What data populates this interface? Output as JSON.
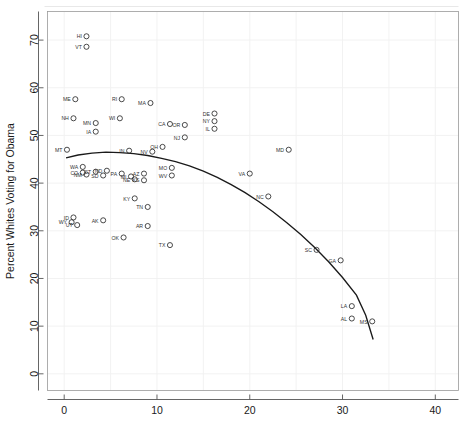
{
  "chart_data": {
    "type": "scatter",
    "title": "",
    "xlabel": "",
    "ylabel": "Percent Whites Voting for Obama",
    "xlim": [
      -1.8,
      42.5
    ],
    "ylim": [
      -3.5,
      76.0
    ],
    "xticks": [
      0,
      10,
      20,
      30,
      40
    ],
    "yticks": [
      0,
      10,
      20,
      30,
      40,
      50,
      60,
      70
    ],
    "xtick_labels": [
      "0",
      "10",
      "20",
      "30",
      "40"
    ],
    "ytick_labels": [
      "0",
      "10",
      "20",
      "30",
      "40",
      "50",
      "60",
      "70"
    ],
    "grid": true,
    "grid_color": "#f0f0f0",
    "legend": "none",
    "marker": "open-circle",
    "marker_color": "#2b2b2b",
    "label_position": "left-of-marker",
    "points": [
      {
        "label": "HI",
        "x": 2.4,
        "y": 70.8
      },
      {
        "label": "VT",
        "x": 2.4,
        "y": 68.6
      },
      {
        "label": "ME",
        "x": 1.2,
        "y": 57.6
      },
      {
        "label": "RI",
        "x": 6.2,
        "y": 57.6
      },
      {
        "label": "MA",
        "x": 9.3,
        "y": 56.8
      },
      {
        "label": "NH",
        "x": 1.0,
        "y": 53.6
      },
      {
        "label": "MN",
        "x": 3.4,
        "y": 52.6
      },
      {
        "label": "WI",
        "x": 6.0,
        "y": 53.6
      },
      {
        "label": "CA",
        "x": 11.4,
        "y": 52.4
      },
      {
        "label": "OR",
        "x": 13.0,
        "y": 52.2
      },
      {
        "label": "IA",
        "x": 3.4,
        "y": 50.8
      },
      {
        "label": "NJ",
        "x": 13.0,
        "y": 49.6
      },
      {
        "label": "DE",
        "x": 16.2,
        "y": 54.6
      },
      {
        "label": "NY",
        "x": 16.2,
        "y": 53.0
      },
      {
        "label": "IL",
        "x": 16.2,
        "y": 51.4
      },
      {
        "label": "MD",
        "x": 24.2,
        "y": 47.0
      },
      {
        "label": "MT",
        "x": 0.3,
        "y": 47.0
      },
      {
        "label": "IN",
        "x": 7.0,
        "y": 46.8
      },
      {
        "label": "NV",
        "x": 9.5,
        "y": 46.6
      },
      {
        "label": "OH",
        "x": 10.6,
        "y": 47.6
      },
      {
        "label": "WA",
        "x": 2.0,
        "y": 43.4
      },
      {
        "label": "CO",
        "x": 2.0,
        "y": 42.2
      },
      {
        "label": "NM",
        "x": 2.4,
        "y": 41.8
      },
      {
        "label": "CT",
        "x": 3.4,
        "y": 42.4
      },
      {
        "label": "SD",
        "x": 4.2,
        "y": 41.6
      },
      {
        "label": "ND",
        "x": 4.6,
        "y": 42.6
      },
      {
        "label": "PA",
        "x": 6.2,
        "y": 42.0
      },
      {
        "label": "MI",
        "x": 7.2,
        "y": 41.4
      },
      {
        "label": "NE",
        "x": 7.6,
        "y": 40.8
      },
      {
        "label": "AZ",
        "x": 8.6,
        "y": 42.0
      },
      {
        "label": "KS",
        "x": 8.6,
        "y": 40.6
      },
      {
        "label": "MO",
        "x": 11.6,
        "y": 43.2
      },
      {
        "label": "WV",
        "x": 11.6,
        "y": 41.6
      },
      {
        "label": "VA",
        "x": 20.0,
        "y": 42.0
      },
      {
        "label": "KY",
        "x": 7.6,
        "y": 36.8
      },
      {
        "label": "TN",
        "x": 9.0,
        "y": 35.0
      },
      {
        "label": "NC",
        "x": 22.0,
        "y": 37.2
      },
      {
        "label": "WY",
        "x": 0.8,
        "y": 31.8
      },
      {
        "label": "ID",
        "x": 1.0,
        "y": 32.8
      },
      {
        "label": "UT",
        "x": 1.4,
        "y": 31.2
      },
      {
        "label": "AK",
        "x": 4.2,
        "y": 32.2
      },
      {
        "label": "AR",
        "x": 9.0,
        "y": 31.0
      },
      {
        "label": "OK",
        "x": 6.4,
        "y": 28.6
      },
      {
        "label": "TX",
        "x": 11.4,
        "y": 27.0
      },
      {
        "label": "SC",
        "x": 27.2,
        "y": 26.0
      },
      {
        "label": "GA",
        "x": 29.8,
        "y": 23.8
      },
      {
        "label": "LA",
        "x": 31.0,
        "y": 14.2
      },
      {
        "label": "AL",
        "x": 31.0,
        "y": 11.6
      },
      {
        "label": "MS",
        "x": 33.2,
        "y": 11.0
      }
    ],
    "fit_curve": {
      "type": "loess",
      "color": "#1a1a1a",
      "points": [
        {
          "x": 0.2,
          "y": 45.3
        },
        {
          "x": 1.5,
          "y": 45.9
        },
        {
          "x": 3.0,
          "y": 46.3
        },
        {
          "x": 4.5,
          "y": 46.5
        },
        {
          "x": 6.0,
          "y": 46.4
        },
        {
          "x": 7.5,
          "y": 46.2
        },
        {
          "x": 9.0,
          "y": 45.8
        },
        {
          "x": 10.5,
          "y": 45.2
        },
        {
          "x": 12.0,
          "y": 44.5
        },
        {
          "x": 13.5,
          "y": 43.6
        },
        {
          "x": 15.0,
          "y": 42.5
        },
        {
          "x": 16.5,
          "y": 41.2
        },
        {
          "x": 18.0,
          "y": 39.7
        },
        {
          "x": 19.5,
          "y": 38.0
        },
        {
          "x": 21.0,
          "y": 36.1
        },
        {
          "x": 22.5,
          "y": 34.0
        },
        {
          "x": 24.0,
          "y": 31.7
        },
        {
          "x": 25.5,
          "y": 29.2
        },
        {
          "x": 27.0,
          "y": 26.5
        },
        {
          "x": 28.5,
          "y": 23.5
        },
        {
          "x": 30.0,
          "y": 20.2
        },
        {
          "x": 31.5,
          "y": 16.5
        },
        {
          "x": 32.5,
          "y": 12.3
        },
        {
          "x": 33.3,
          "y": 7.2
        }
      ]
    }
  }
}
